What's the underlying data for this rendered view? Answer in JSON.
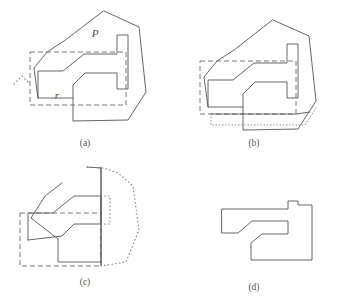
{
  "figure": {
    "stroke_color": "#555555",
    "dash_color": "#6b6b6b",
    "dot_color": "#7a7a7a",
    "background": "#ffffff"
  },
  "labels": {
    "polygon": "P",
    "rectangle": "r"
  },
  "panels": [
    {
      "id": "a",
      "caption": "(a)",
      "caption_x": 85,
      "caption_y": 146,
      "description": "Polygon P overlaid with dashed query rectangle r",
      "polygon_points": "104,11 139,27 146,92 128,120 73,121 73,98 38,98 34,68 47,52 64,41",
      "notch_points": "38,98 38,71 63,71 84,54 117,54 117,35 128,35 128,89 117,89 117,73 85,73 73,85 73,98",
      "rect_points": "30,52 126,52 126,105 30,105",
      "corner_dots": "14,84 22,76 30,84",
      "label_polygon_x": 95,
      "label_polygon_y": 37,
      "label_rect_x": 57,
      "label_rect_y": 99
    },
    {
      "id": "b",
      "caption": "(b)",
      "caption_x": 254,
      "caption_y": 146,
      "description": "Rectangle r clipped against bottom edge; removed strip shown dotted",
      "polygon_points": "273,20 309,36 316,101 298,129 243,130 243,107 208,107 204,77 217,61 234,50",
      "notch_points": "208,107 208,80 233,80 254,63 287,63 287,44 298,44 298,98 287,98 287,82 255,82 243,94 243,107",
      "rect_points": "200,61 296,61 296,114 200,114",
      "dotted_region": "211,114 211,125 305,125 316,108",
      "solid_bottom": "211,114 296,114 310,112"
    },
    {
      "id": "c",
      "caption": "(c)",
      "caption_x": 85,
      "caption_y": 285,
      "description": "Polygon cut by vertical line; right portion shown dotted",
      "polygon_solid": "87,167 101,168 101,262 58,262 58,239 31,218 45,196 62,183",
      "notch_points": "28,240 28,213 53,213 74,196 101,196 101,224 74,224 62,236 28,240",
      "rect_points": "20,213 101,213 101,266 20,266",
      "cut_line": "101,167 101,266",
      "dotted_outline": "87,167 103,168 118,173 133,186 139,230 126,262 101,266",
      "dotted_inner": "101,196 110,196 110,224 101,224"
    },
    {
      "id": "d",
      "caption": "(d)",
      "caption_x": 254,
      "caption_y": 290,
      "description": "Resulting trimmed piece after clipping",
      "outline_points": "222,209 288,209 288,201 298,201 298,205 312,205 312,260 251,260 251,243 262,234 288,234 288,221 252,221 238,233 222,233"
    }
  ],
  "icons": {
    "dotted_corner": "corner-dots-icon",
    "cut_line": "vertical-cut-line-icon"
  }
}
